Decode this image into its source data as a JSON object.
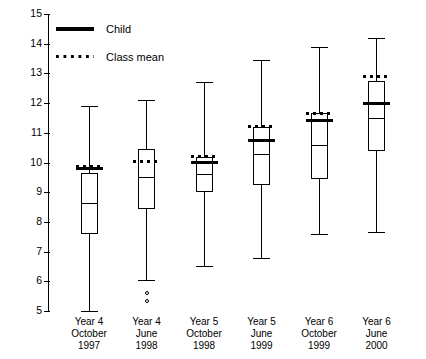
{
  "chart_data": {
    "type": "box",
    "title": "",
    "xlabel": "",
    "ylabel": "",
    "ylim": [
      5,
      15
    ],
    "ytick_values": [
      5,
      6,
      7,
      8,
      9,
      10,
      11,
      12,
      13,
      14,
      15
    ],
    "ytick_labels": [
      "5",
      "6",
      "7",
      "8",
      "9",
      "10",
      "11",
      "12",
      "13",
      "14",
      "15"
    ],
    "grid": false,
    "legend_position": "upper-left",
    "legend": [
      {
        "label": "Child",
        "style": "solid-thick"
      },
      {
        "label": "Class mean",
        "style": "dotted"
      }
    ],
    "categories": [
      "Year 4\nOctober\n1997",
      "Year 4\nJune\n1998",
      "Year 5\nOctober\n1998",
      "Year 5\nJune\n1999",
      "Year 6\nOctober\n1999",
      "Year 6\nJune\n2000"
    ],
    "boxes": [
      {
        "category": "Year 4 October 1997",
        "line1": "Year 4",
        "line2": "October",
        "line3": "1997",
        "whisker_low": 5.0,
        "q1": 7.6,
        "median": 8.65,
        "q3": 9.65,
        "whisker_high": 11.9,
        "child": 9.8,
        "class_mean": 9.85,
        "outliers": []
      },
      {
        "category": "Year 4 June 1998",
        "line1": "Year 4",
        "line2": "June",
        "line3": "1998",
        "whisker_low": 6.05,
        "q1": 8.45,
        "median": 9.5,
        "q3": 10.45,
        "whisker_high": 12.1,
        "child": null,
        "class_mean": 10.05,
        "outliers": [
          5.6,
          5.35
        ]
      },
      {
        "category": "Year 5 October 1998",
        "line1": "Year 5",
        "line2": "October",
        "line3": "1998",
        "whisker_low": 6.5,
        "q1": 9.0,
        "median": 9.6,
        "q3": 10.2,
        "whisker_high": 12.7,
        "child": 10.0,
        "class_mean": 10.2,
        "outliers": []
      },
      {
        "category": "Year 5 June 1999",
        "line1": "Year 5",
        "line2": "June",
        "line3": "1999",
        "whisker_low": 6.8,
        "q1": 9.25,
        "median": 10.3,
        "q3": 11.2,
        "whisker_high": 13.45,
        "child": 10.75,
        "class_mean": 11.2,
        "outliers": []
      },
      {
        "category": "Year 6 October 1999",
        "line1": "Year 6",
        "line2": "October",
        "line3": "1999",
        "whisker_low": 7.6,
        "q1": 9.45,
        "median": 10.6,
        "q3": 11.65,
        "whisker_high": 13.9,
        "child": 11.4,
        "class_mean": 11.65,
        "outliers": []
      },
      {
        "category": "Year 6 June 2000",
        "line1": "Year 6",
        "line2": "June",
        "line3": "2000",
        "whisker_low": 7.65,
        "q1": 10.4,
        "median": 11.5,
        "q3": 12.75,
        "whisker_high": 14.2,
        "child": 12.0,
        "class_mean": 12.9,
        "outliers": []
      }
    ]
  }
}
